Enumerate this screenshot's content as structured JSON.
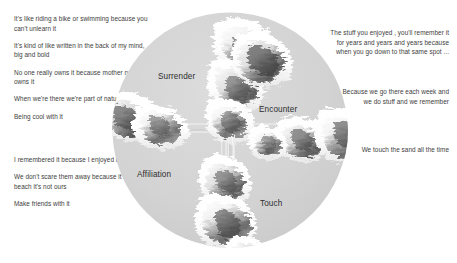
{
  "diagram": {
    "circle": {
      "fill_color": "#d2d2d2",
      "quadrants": [
        {
          "id": "surrender",
          "label": "Surrender"
        },
        {
          "id": "encounter",
          "label": "Encounter"
        },
        {
          "id": "affiliation",
          "label": "Affiliation"
        },
        {
          "id": "touch",
          "label": "Touch"
        }
      ]
    }
  },
  "quotes": {
    "top_left": [
      "It's like riding a bike or swimming because you can't unlearn it",
      "It's kind of like written in the back of my mind, big and bold",
      "No one really owns it because mother nature owns it",
      "When we're there we're part of nature",
      "Being cool with it"
    ],
    "bottom_left": [
      "I remembered it because I enjoyed it",
      "We don't scare them away because it's their beach it's not ours",
      "Make friends with it"
    ],
    "top_right": [
      "The stuff you enjoyed , you'll remember it for years and years and years because when you go down to that same spot ..."
    ],
    "mid_right": [
      "Because we go there each week and we do stuff and we remember"
    ],
    "low_right": [
      "We touch the sand all the time"
    ]
  }
}
